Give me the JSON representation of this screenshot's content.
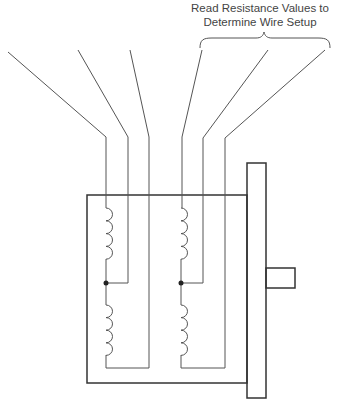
{
  "annotation": {
    "line1": "Read Resistance Values to",
    "line2": "Determine Wire Setup"
  },
  "diagram": {
    "type": "stepper-motor-wiring",
    "lead_count": 6,
    "coil_count": 4,
    "center_taps": 2,
    "colors": {
      "wire": "#555555",
      "frame": "#333333"
    }
  }
}
